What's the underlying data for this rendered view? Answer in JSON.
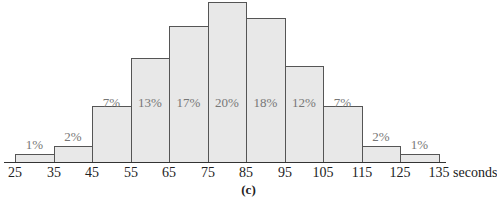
{
  "chart_data": {
    "type": "bar",
    "subtype": "histogram",
    "title": "",
    "caption": "(c)",
    "xlabel": "seconds",
    "ylabel": "",
    "bin_edges": [
      25,
      35,
      45,
      55,
      65,
      75,
      85,
      95,
      105,
      115,
      125,
      135
    ],
    "categories": [
      "25-35",
      "35-45",
      "45-55",
      "55-65",
      "65-75",
      "75-85",
      "85-95",
      "95-105",
      "105-115",
      "115-125",
      "125-135"
    ],
    "values": [
      1,
      2,
      7,
      13,
      17,
      20,
      18,
      12,
      7,
      2,
      1
    ],
    "value_labels": [
      "1%",
      "2%",
      "7%",
      "13%",
      "17%",
      "20%",
      "18%",
      "12%",
      "7%",
      "2%",
      "1%"
    ],
    "tick_labels": [
      "25",
      "35",
      "45",
      "55",
      "65",
      "75",
      "85",
      "95",
      "105",
      "115",
      "125",
      "135"
    ],
    "grid": false,
    "legend": null,
    "colors": {
      "bar_fill": "#e8e8e8",
      "bar_edge": "#555555",
      "label": "#777777",
      "axis": "#333333"
    }
  }
}
